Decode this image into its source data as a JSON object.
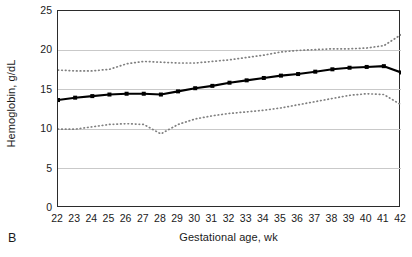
{
  "figure": {
    "panel_label": "B",
    "background_color": "#ffffff",
    "frame_color": "#2b2b2b",
    "gridline_color": "#c9c9c9",
    "median_color": "#000000",
    "percentile_color": "#808080"
  },
  "chart_data": {
    "type": "line",
    "title": "",
    "xlabel": "Gestational age, wk",
    "ylabel": "Hemoglobin, g/dL",
    "xlim": [
      22,
      42
    ],
    "ylim": [
      0,
      25
    ],
    "grid": true,
    "grid_axis": "y",
    "legend_position": "none",
    "x_tick_labels": [
      "22",
      "23",
      "24",
      "25",
      "26",
      "27",
      "28",
      "29",
      "30",
      "31",
      "32",
      "33",
      "34",
      "35",
      "36",
      "37",
      "38",
      "39",
      "40",
      "41",
      "42"
    ],
    "y_tick_labels": [
      "0",
      "5",
      "10",
      "15",
      "20",
      "25"
    ],
    "y_ticks": [
      0,
      5,
      10,
      15,
      20,
      25
    ],
    "x": [
      22,
      23,
      24,
      25,
      26,
      27,
      28,
      29,
      30,
      31,
      32,
      33,
      34,
      35,
      36,
      37,
      38,
      39,
      40,
      41,
      42
    ],
    "series": [
      {
        "name": "Upper percentile",
        "style": "dotted",
        "marker": "none",
        "color": "#808080",
        "values": [
          17.5,
          17.4,
          17.4,
          17.6,
          18.3,
          18.6,
          18.5,
          18.4,
          18.4,
          18.6,
          18.8,
          19.1,
          19.4,
          19.8,
          20.0,
          20.1,
          20.2,
          20.2,
          20.3,
          20.6,
          22.0
        ]
      },
      {
        "name": "Median",
        "style": "solid",
        "marker": "square",
        "color": "#000000",
        "values": [
          13.7,
          14.0,
          14.2,
          14.4,
          14.5,
          14.5,
          14.4,
          14.8,
          15.2,
          15.5,
          15.9,
          16.2,
          16.5,
          16.8,
          17.0,
          17.3,
          17.6,
          17.8,
          17.9,
          18.0,
          17.2
        ]
      },
      {
        "name": "Lower percentile",
        "style": "dotted",
        "marker": "none",
        "color": "#808080",
        "values": [
          10.0,
          10.0,
          10.3,
          10.6,
          10.7,
          10.6,
          9.4,
          10.6,
          11.3,
          11.7,
          12.0,
          12.2,
          12.4,
          12.7,
          13.1,
          13.5,
          13.9,
          14.3,
          14.5,
          14.4,
          13.1
        ]
      }
    ]
  }
}
